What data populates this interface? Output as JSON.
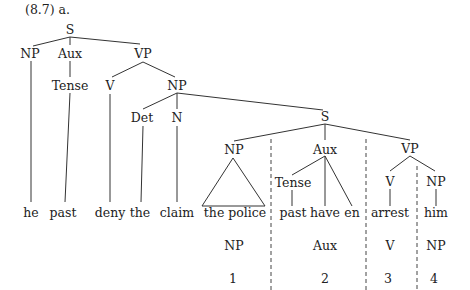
{
  "title": "(8.7) a.",
  "tree": {
    "root": "S",
    "level1": [
      "NP",
      "Aux",
      "VP"
    ],
    "level2": [
      "Tense",
      "V",
      "NP"
    ],
    "level3": [
      "Det",
      "N"
    ],
    "embedded_root": "S",
    "embedded_level1": [
      "NP",
      "Aux",
      "VP"
    ],
    "embedded_level2": [
      "Tense",
      "V",
      "NP"
    ]
  },
  "leaves": [
    "he",
    "past",
    "deny",
    "the",
    "claim",
    "the police",
    "past",
    "have",
    "en",
    "arrest",
    "him"
  ],
  "analysis": {
    "categories": [
      "NP",
      "Aux",
      "V",
      "NP"
    ],
    "indices": [
      "1",
      "2",
      "3",
      "4"
    ]
  }
}
